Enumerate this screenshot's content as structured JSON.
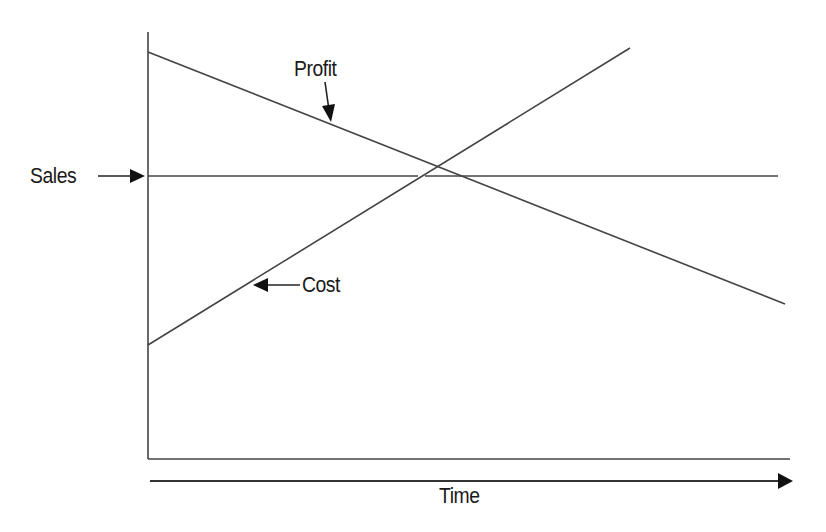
{
  "diagram": {
    "type": "conceptual line diagram",
    "stroke_color": "#3a3a3a",
    "labels": {
      "sales": "Sales",
      "profit": "Profit",
      "cost": "Cost",
      "time": "Time"
    },
    "x_axis_label": "Time",
    "lines": [
      {
        "name": "Profit",
        "trend": "decreasing",
        "from": [
          148,
          52
        ],
        "to": [
          785,
          304
        ]
      },
      {
        "name": "Sales",
        "trend": "constant",
        "from": [
          148,
          176
        ],
        "to": [
          778,
          176
        ]
      },
      {
        "name": "Cost",
        "trend": "increasing",
        "from": [
          148,
          345
        ],
        "to": [
          630,
          48
        ]
      }
    ]
  }
}
